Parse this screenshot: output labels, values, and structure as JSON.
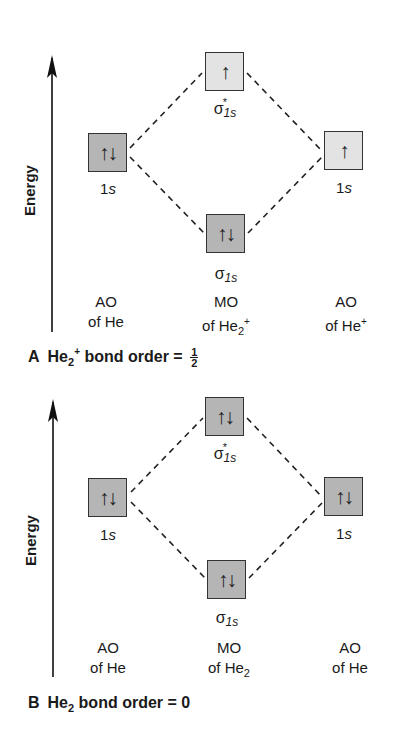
{
  "panels": [
    {
      "id": "A",
      "axis_label": "Energy",
      "left_ao": {
        "label": "1s",
        "electrons": "↑↓",
        "shade": "dark"
      },
      "antibonding_mo": {
        "label": "σ",
        "sub": "1s",
        "star": "*",
        "electrons": "↑",
        "shade": "light"
      },
      "bonding_mo": {
        "label": "σ",
        "sub": "1s",
        "electrons": "↑↓",
        "shade": "dark"
      },
      "right_ao": {
        "label": "1s",
        "electrons": "↑",
        "shade": "light"
      },
      "columns": [
        {
          "line1": "AO",
          "line2": "of He",
          "sub": "",
          "sup": ""
        },
        {
          "line1": "MO",
          "line2": "of He",
          "sub": "2",
          "sup": "+"
        },
        {
          "line1": "AO",
          "line2": "of He",
          "sub": "",
          "sup": "+"
        }
      ],
      "caption": {
        "letter": "A",
        "species": "He",
        "sub": "2",
        "sup": "+",
        "text": "bond order =",
        "value_num": "1",
        "value_den": "2"
      }
    },
    {
      "id": "B",
      "axis_label": "Energy",
      "left_ao": {
        "label": "1s",
        "electrons": "↑↓",
        "shade": "dark"
      },
      "antibonding_mo": {
        "label": "σ",
        "sub": "1s",
        "star": "*",
        "electrons": "↑↓",
        "shade": "dark"
      },
      "bonding_mo": {
        "label": "σ",
        "sub": "1s",
        "electrons": "↑↓",
        "shade": "dark"
      },
      "right_ao": {
        "label": "1s",
        "electrons": "↑↓",
        "shade": "dark"
      },
      "columns": [
        {
          "line1": "AO",
          "line2": "of He",
          "sub": "",
          "sup": ""
        },
        {
          "line1": "MO",
          "line2": "of He",
          "sub": "2",
          "sup": ""
        },
        {
          "line1": "AO",
          "line2": "of He",
          "sub": "",
          "sup": ""
        }
      ],
      "caption": {
        "letter": "B",
        "species": "He",
        "sub": "2",
        "sup": "",
        "text": "bond order = 0"
      }
    }
  ]
}
